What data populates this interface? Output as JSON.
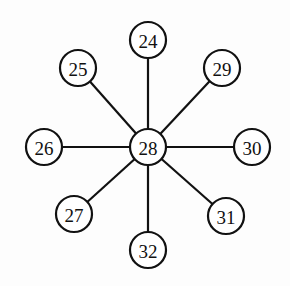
{
  "diagram": {
    "type": "star-graph",
    "center": "28",
    "nodes": [
      {
        "id": "28",
        "label": "28",
        "x": 148,
        "y": 147
      },
      {
        "id": "24",
        "label": "24",
        "x": 148,
        "y": 40
      },
      {
        "id": "25",
        "label": "25",
        "x": 78,
        "y": 68
      },
      {
        "id": "29",
        "label": "29",
        "x": 222,
        "y": 68
      },
      {
        "id": "26",
        "label": "26",
        "x": 44,
        "y": 147
      },
      {
        "id": "30",
        "label": "30",
        "x": 252,
        "y": 147
      },
      {
        "id": "27",
        "label": "27",
        "x": 74,
        "y": 214
      },
      {
        "id": "31",
        "label": "31",
        "x": 226,
        "y": 216
      },
      {
        "id": "32",
        "label": "32",
        "x": 148,
        "y": 250
      }
    ],
    "edges": [
      [
        "28",
        "24"
      ],
      [
        "28",
        "25"
      ],
      [
        "28",
        "29"
      ],
      [
        "28",
        "26"
      ],
      [
        "28",
        "30"
      ],
      [
        "28",
        "27"
      ],
      [
        "28",
        "31"
      ],
      [
        "28",
        "32"
      ]
    ],
    "node_radius": 18
  }
}
